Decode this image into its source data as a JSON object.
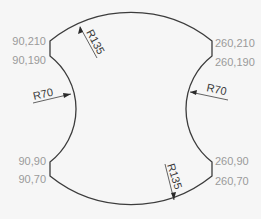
{
  "diagram": {
    "type": "technical-drawing",
    "shape": "profile with two R135 convex arcs (top/bottom) and two R70 concave arcs (left/right)",
    "vertices": [
      {
        "id": "tl1",
        "label": "90,210"
      },
      {
        "id": "tl2",
        "label": "90,190"
      },
      {
        "id": "bl1",
        "label": "90,90"
      },
      {
        "id": "bl2",
        "label": "90,70"
      },
      {
        "id": "tr1",
        "label": "260,210"
      },
      {
        "id": "tr2",
        "label": "260,190"
      },
      {
        "id": "br1",
        "label": "260,90"
      },
      {
        "id": "br2",
        "label": "260,70"
      }
    ],
    "dimensions": {
      "top_radius": "R135",
      "bottom_radius": "R135",
      "left_radius": "R70",
      "right_radius": "R70"
    },
    "colors": {
      "outline": "#3c3c3c",
      "coordinate_text": "#9a9a9a",
      "dimension_text": "#3a3a3a",
      "background": "#f6f6f6"
    }
  }
}
